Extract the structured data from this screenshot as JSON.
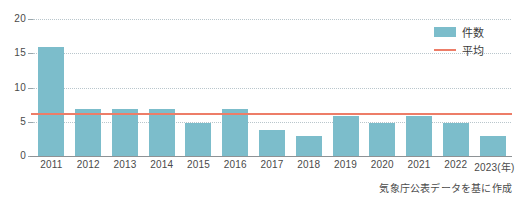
{
  "chart_data": {
    "type": "bar",
    "title": "",
    "subtitle": "",
    "xlabel": "(年)",
    "ylabel": "",
    "ylim": [
      0,
      20
    ],
    "yticks": [
      0,
      5,
      10,
      15,
      20
    ],
    "grid": true,
    "categories": [
      "2011",
      "2012",
      "2013",
      "2014",
      "2015",
      "2016",
      "2017",
      "2018",
      "2019",
      "2020",
      "2021",
      "2022",
      "2023(年)"
    ],
    "series": [
      {
        "name": "件数",
        "type": "bar",
        "color": "#7cbdcb",
        "values": [
          16,
          7,
          7,
          7,
          5,
          7,
          4,
          3,
          6,
          5,
          6,
          5,
          3
        ]
      },
      {
        "name": "平均",
        "type": "line",
        "color": "#ed7d68",
        "value": 6.1
      }
    ],
    "legend": {
      "position": "top-right",
      "entries": [
        {
          "label": "件数",
          "marker": "bar-swatch",
          "color": "#7cbdcb"
        },
        {
          "label": "平均",
          "marker": "line-swatch",
          "color": "#ed7d68"
        }
      ]
    },
    "annotations": {
      "source_note": "気象庁公表データを基に作成"
    }
  },
  "colors": {
    "bar": "#7cbdcb",
    "average_line": "#ed7d68",
    "gridline": "#b9c6cc",
    "axis": "#8e9295",
    "text": "#3a3a3a",
    "background": "#ffffff"
  }
}
